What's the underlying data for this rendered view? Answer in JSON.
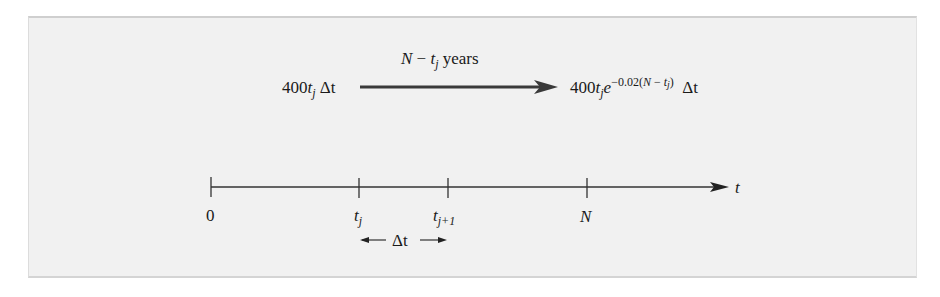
{
  "diagram": {
    "type": "timeline",
    "colors": {
      "background": "#f1f1f1",
      "line": "#333333",
      "text": "#1a1a1a"
    },
    "transfer": {
      "start_expr": {
        "coef": "400",
        "var": "t",
        "sub": "j",
        "suffix": "Δt"
      },
      "arrow_label": {
        "prefix": "N",
        "minus": " − ",
        "var": "t",
        "sub": "j",
        "suffix": " years"
      },
      "end_expr": {
        "coef": "400",
        "var": "t",
        "sub": "j",
        "base": "e",
        "exp_prefix": "−0.02(",
        "exp_N": "N",
        "exp_minus": " − ",
        "exp_var": "t",
        "exp_sub": "j",
        "exp_close": ")",
        "suffix": "Δt"
      }
    },
    "axis": {
      "label": "t",
      "ticks": [
        {
          "label": "0"
        },
        {
          "label": "t",
          "sub": "j"
        },
        {
          "label": "t",
          "sub": "j+1"
        },
        {
          "label": "N"
        }
      ]
    },
    "interval": {
      "label": "Δt"
    }
  }
}
